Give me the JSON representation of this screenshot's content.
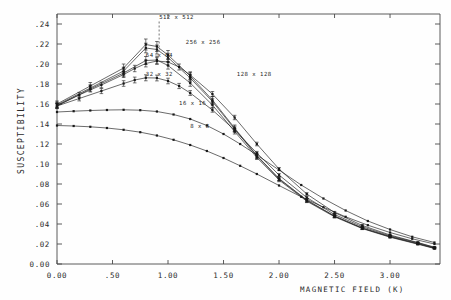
{
  "chart_data": {
    "type": "line",
    "title": "",
    "xlabel": "MAGNETIC FIELD (K)",
    "ylabel": "SUSCEPTIBILITY",
    "xlim": [
      0.0,
      3.45
    ],
    "ylim": [
      0.0,
      0.25
    ],
    "grid": false,
    "legend_position": "inline-annotations",
    "xticks": [
      0.0,
      0.5,
      1.0,
      1.5,
      2.0,
      2.5,
      3.0
    ],
    "xticklabels": [
      "0.00",
      ".50",
      "1.00",
      "1.50",
      "2.00",
      "2.50",
      "3.00"
    ],
    "yticks": [
      0.0,
      0.02,
      0.04,
      0.06,
      0.08,
      0.1,
      0.12,
      0.14,
      0.16,
      0.18,
      0.2,
      0.22,
      0.24
    ],
    "yticklabels": [
      "0.00",
      ".02",
      ".04",
      ".06",
      ".08",
      ".10",
      ".12",
      ".14",
      ".16",
      ".18",
      ".20",
      ".22",
      ".24"
    ],
    "series": [
      {
        "name": "512 x 512",
        "label": "512 x 512",
        "label_x": 0.92,
        "label_y": 0.2455,
        "has_errorbars": true,
        "x": [
          0.0,
          0.3,
          0.6,
          0.8,
          0.9,
          1.0,
          1.2,
          1.4,
          1.6,
          1.8,
          2.0,
          2.25,
          2.5,
          2.75,
          3.0,
          3.25,
          3.4
        ],
        "y": [
          0.16,
          0.178,
          0.196,
          0.2195,
          0.2175,
          0.209,
          0.188,
          0.164,
          0.136,
          0.1085,
          0.0855,
          0.064,
          0.048,
          0.036,
          0.0275,
          0.0205,
          0.016
        ],
        "yerr": [
          0.003,
          0.0035,
          0.004,
          0.0055,
          0.005,
          0.0045,
          0.004,
          0.0035,
          0.003,
          0.0025,
          0.002,
          0.0018,
          0.0015,
          0.0012,
          0.001,
          0.0008,
          0.0007
        ]
      },
      {
        "name": "256 x 256",
        "label": "256 x 256",
        "label_x": 1.16,
        "label_y": 0.2205,
        "has_errorbars": true,
        "x": [
          0.0,
          0.3,
          0.6,
          0.8,
          0.9,
          1.0,
          1.2,
          1.4,
          1.6,
          1.8,
          2.0,
          2.25,
          2.5,
          2.75,
          3.0,
          3.25,
          3.4
        ],
        "y": [
          0.159,
          0.176,
          0.193,
          0.216,
          0.2145,
          0.2065,
          0.186,
          0.1625,
          0.135,
          0.108,
          0.085,
          0.0635,
          0.0478,
          0.0358,
          0.0272,
          0.0202,
          0.0158
        ],
        "yerr": [
          0.0028,
          0.0032,
          0.0038,
          0.0048,
          0.0045,
          0.0042,
          0.0038,
          0.0032,
          0.0028,
          0.0022,
          0.0018,
          0.0016,
          0.0014,
          0.0011,
          0.0009,
          0.0008,
          0.0006
        ]
      },
      {
        "name": "128 x 128",
        "label": "128 x 128",
        "label_x": 1.62,
        "label_y": 0.1885,
        "has_errorbars": true,
        "x": [
          0.0,
          0.3,
          0.6,
          0.8,
          0.9,
          1.0,
          1.2,
          1.4,
          1.6,
          1.8,
          2.0,
          2.25,
          2.5,
          2.75,
          3.0,
          3.25,
          3.4
        ],
        "y": [
          0.158,
          0.175,
          0.191,
          0.2035,
          0.204,
          0.1985,
          0.181,
          0.159,
          0.1325,
          0.1065,
          0.084,
          0.0628,
          0.0472,
          0.0354,
          0.0268,
          0.0198,
          0.0155
        ],
        "yerr": [
          0.0026,
          0.003,
          0.0034,
          0.004,
          0.0038,
          0.0036,
          0.0033,
          0.0029,
          0.0025,
          0.002,
          0.0017,
          0.0014,
          0.0012,
          0.001,
          0.0008,
          0.0007,
          0.0006
        ]
      },
      {
        "name": "64 x 64",
        "label": "64 x 64",
        "label_x": 0.8,
        "label_y": 0.2075,
        "has_errorbars": true,
        "x": [
          0.0,
          0.2,
          0.4,
          0.6,
          0.7,
          0.8,
          0.9,
          1.0,
          1.1,
          1.2,
          1.4,
          1.6,
          1.8,
          2.0,
          2.25,
          2.5,
          2.75,
          3.0,
          3.25,
          3.4
        ],
        "y": [
          0.1585,
          0.169,
          0.179,
          0.1895,
          0.1955,
          0.2005,
          0.203,
          0.202,
          0.197,
          0.189,
          0.17,
          0.1465,
          0.12,
          0.095,
          0.07,
          0.0515,
          0.0385,
          0.029,
          0.0215,
          0.0168
        ],
        "yerr": [
          0.0024,
          0.0026,
          0.0028,
          0.003,
          0.0032,
          0.0034,
          0.0033,
          0.0032,
          0.003,
          0.0028,
          0.0025,
          0.0022,
          0.0018,
          0.0015,
          0.0013,
          0.0011,
          0.0009,
          0.0008,
          0.0006,
          0.0005
        ]
      },
      {
        "name": "32 x 32",
        "label": "32 x 32",
        "label_x": 0.8,
        "label_y": 0.1885,
        "has_errorbars": true,
        "x": [
          0.0,
          0.2,
          0.4,
          0.6,
          0.7,
          0.8,
          0.9,
          1.0,
          1.1,
          1.2,
          1.4,
          1.6,
          1.8,
          2.0,
          2.25,
          2.5,
          2.75,
          3.0,
          3.25,
          3.4
        ],
        "y": [
          0.158,
          0.1655,
          0.173,
          0.1805,
          0.184,
          0.1862,
          0.186,
          0.183,
          0.178,
          0.171,
          0.154,
          0.134,
          0.111,
          0.089,
          0.0665,
          0.0495,
          0.0372,
          0.0282,
          0.0212,
          0.0165
        ],
        "yerr": [
          0.0022,
          0.0024,
          0.0026,
          0.0028,
          0.0029,
          0.003,
          0.0029,
          0.0028,
          0.0026,
          0.0024,
          0.0022,
          0.0019,
          0.0016,
          0.0014,
          0.0012,
          0.001,
          0.0008,
          0.0007,
          0.0006,
          0.0005
        ]
      },
      {
        "name": "16 x 16",
        "label": "16 x 16",
        "label_x": 1.1,
        "label_y": 0.159,
        "has_errorbars": false,
        "x": [
          0.0,
          0.15,
          0.3,
          0.45,
          0.6,
          0.75,
          0.9,
          1.05,
          1.2,
          1.35,
          1.5,
          1.65,
          1.8,
          2.0,
          2.2,
          2.4,
          2.6,
          2.8,
          3.0,
          3.2,
          3.4
        ],
        "y": [
          0.152,
          0.1528,
          0.1535,
          0.154,
          0.1542,
          0.1538,
          0.1525,
          0.1495,
          0.145,
          0.1385,
          0.13,
          0.12,
          0.109,
          0.094,
          0.079,
          0.0655,
          0.0535,
          0.043,
          0.0345,
          0.0272,
          0.0215
        ]
      },
      {
        "name": "8 x 8",
        "label": "8 x 8",
        "label_x": 1.2,
        "label_y": 0.1365,
        "has_errorbars": false,
        "x": [
          0.0,
          0.15,
          0.3,
          0.45,
          0.6,
          0.75,
          0.9,
          1.05,
          1.2,
          1.35,
          1.5,
          1.65,
          1.8,
          2.0,
          2.2,
          2.4,
          2.6,
          2.8,
          3.0,
          3.2,
          3.4
        ],
        "y": [
          0.1385,
          0.138,
          0.1372,
          0.136,
          0.1342,
          0.1318,
          0.1285,
          0.1242,
          0.119,
          0.113,
          0.106,
          0.0982,
          0.09,
          0.0785,
          0.0672,
          0.0568,
          0.0472,
          0.0388,
          0.0315,
          0.0252,
          0.02
        ]
      }
    ]
  }
}
